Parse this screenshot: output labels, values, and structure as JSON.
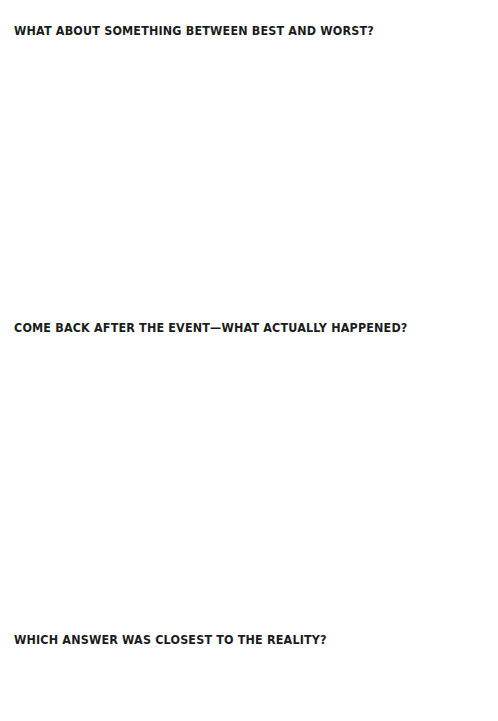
{
  "page": {
    "prompts": [
      {
        "text": "WHAT ABOUT SOMETHING BETWEEN BEST AND WORST?"
      },
      {
        "text": "COME BACK AFTER THE EVENT—WHAT ACTUALLY HAPPENED?"
      },
      {
        "text": "WHICH ANSWER WAS CLOSEST TO THE REALITY?"
      }
    ]
  }
}
